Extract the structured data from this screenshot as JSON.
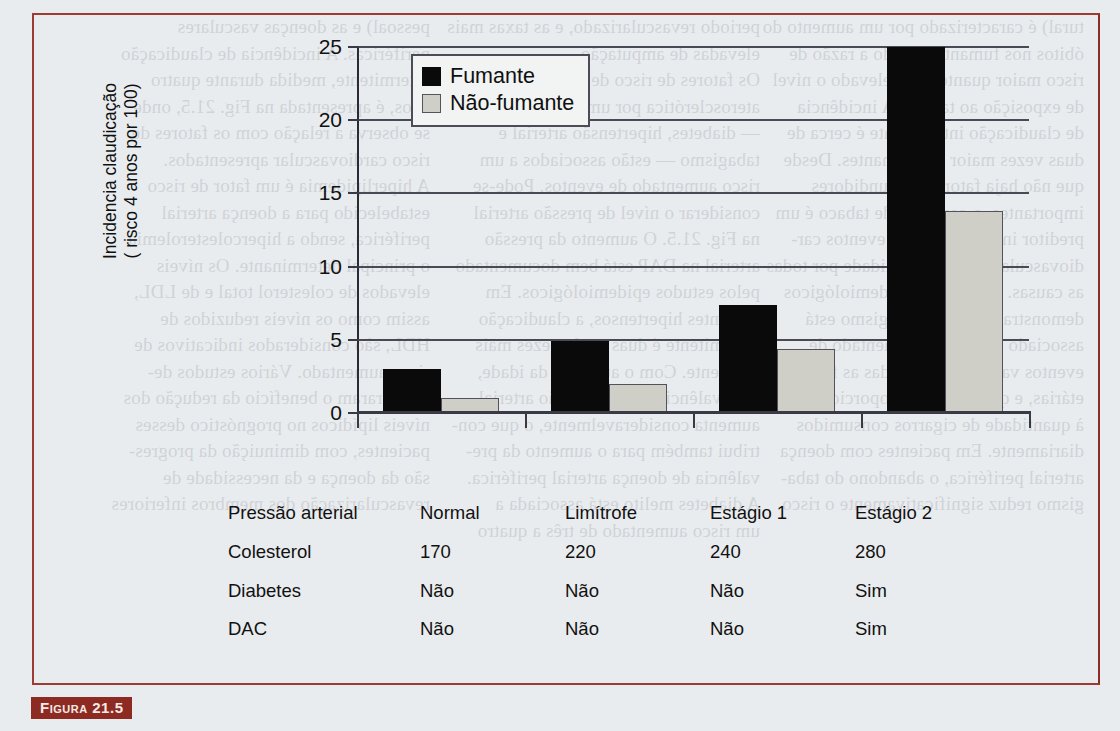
{
  "page": {
    "background_color": "#e9ecee",
    "frame_color": "#9e3b33"
  },
  "caption": {
    "label": "Figura 21.5",
    "badge_color": "#8d2a22"
  },
  "chart_data": {
    "type": "bar",
    "title": "",
    "xlabel": "",
    "ylabel": "Incidencia claudicação ( risco 4 anos por 100)",
    "ylabel_line1": "Incidencia claudicação",
    "ylabel_line2": "( risco 4 anos por 100)",
    "ylim": [
      0,
      25
    ],
    "yticks": [
      0,
      5,
      10,
      15,
      20,
      25
    ],
    "ytick_labels": [
      "0",
      "5",
      "10",
      "15",
      "20",
      "25"
    ],
    "grid": true,
    "legend_position": "top-left",
    "categories": [
      "Normal",
      "Limítrofe",
      "Estágio 1",
      "Estágio 2"
    ],
    "series": [
      {
        "name": "Fumante",
        "color": "#0a0a0a",
        "values": [
          3.0,
          4.9,
          7.4,
          25.0
        ]
      },
      {
        "name": "Não-fumante",
        "color": "#cfcfc8",
        "values": [
          1.0,
          2.0,
          4.4,
          13.8
        ]
      }
    ]
  },
  "legend": {
    "items": [
      {
        "label": "Fumante",
        "swatch": "black-square"
      },
      {
        "label": "Não-fumante",
        "swatch": "gray-square"
      }
    ]
  },
  "table": {
    "rows": [
      {
        "label": "Pressão arterial",
        "values": [
          "Normal",
          "Limítrofe",
          "Estágio 1",
          "Estágio 2"
        ]
      },
      {
        "label": "Colesterol",
        "values": [
          "170",
          "220",
          "240",
          "280"
        ]
      },
      {
        "label": "Diabetes",
        "values": [
          "Não",
          "Não",
          "Não",
          "Sim"
        ]
      },
      {
        "label": "DAC",
        "values": [
          "Não",
          "Não",
          "Não",
          "Sim"
        ]
      }
    ]
  },
  "ghost_text": {
    "col1": "tural) é caracterizado por um aumento do\nóbitos nos fumantes, sendo a razão de\nrisco maior quanto mais elevado o nível\nde exposição ao tabaco. A incidência\nde claudicação intermitente é cerca de\nduas vezes maior nos fumantes. Desde\nque não haja fatores confundidores\nimportantes, o consumo de tabaco é um\npreditor independente de eventos car-\ndiovasculares e de mortalidade por todas\nas causas. Os estudos epidemiológicos\ndemonstraram que o tabagismo está\nassociado a um risco aumentado de\neventos vasculares em todas as faixas\netárias, e que o risco é proporcional\nà quantidade de cigarros consumidos\ndiariamente. Em pacientes com doença\narterial periférica, o abandono do taba-\ngismo reduz significativamente o risco",
    "col2": "periodo revascularizado, e as taxas mais\nelevadas de amputação.\nOs fatores de risco de doença\naterosclerótica por um modo geral\n— diabetes, hipertensão arterial e\ntabagismo — estão associados a um\nrisco aumentado de eventos. Pode-se\nconsiderar o nível de pressão arterial\nna Fig. 21.5. O aumento da pressão\narterial na DAP está bem documentado\npelos estudos epidemiológicos. Em\npacientes hipertensos, a claudicação\nintermitente é duas a três vezes mais\nfrequente. Com o aumento da idade,\na prevalência de hipertensão arterial\naumenta consideravelmente, o que con-\ntribui também para o aumento da pre-\nvalência de doença arterial periférica.\nA diabetes melito está associada a\num risco aumentado de três a quatro",
    "col3": "pessoal) e as doenças vasculares\nperiféricas. A incidência de claudicação\nintermitente, medida durante quatro\nanos, é apresentada na Fig. 21.5, onde\nse observa a relação com os fatores de\nrisco cardiovascular apresentados.\nA hiperlipidemia é um fator de risco\nestabelecido para a doença arterial\nperiférica, sendo a hipercolesterolemia\no principal determinante. Os níveis\nelevados de colesterol total e de LDL,\nassim como os níveis reduzidos de\nHDL, são considerados indicativos de\nrisco aumentado. Vários estudos de-\nmonstraram o benefício da redução dos\nníveis lipídicos no prognóstico desses\npacientes, com diminuição da progres-\nsão da doença e da necessidade de\nrevascularização dos membros inferiores"
  }
}
